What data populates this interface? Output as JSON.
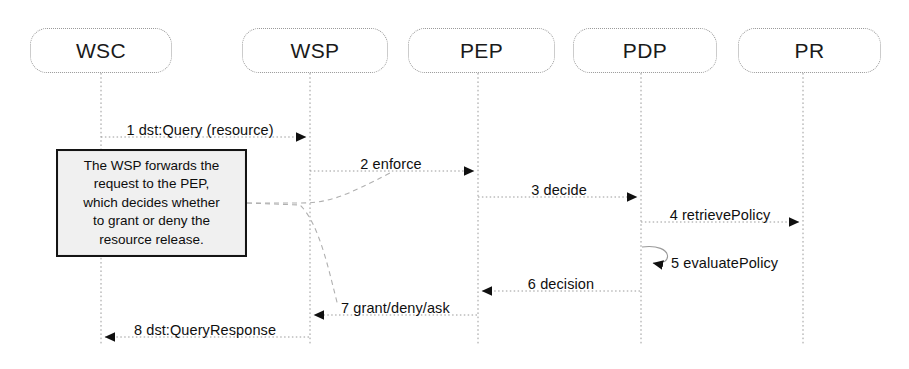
{
  "diagram": {
    "type": "uml-sequence-diagram",
    "title": "",
    "canvas": {
      "width": 909,
      "height": 369
    },
    "colors": {
      "background": "#ffffff",
      "line": "#9a9a9a",
      "arrow": "#1a1a1a",
      "text": "#0f0f0f",
      "note_fill": "#f0f0f0",
      "note_border": "#141414"
    }
  },
  "lifelines": [
    {
      "id": "wsc",
      "label": "WSC",
      "x": 101,
      "box": {
        "left": 30,
        "top": 28,
        "width": 142,
        "height": 45
      },
      "bottom": 345
    },
    {
      "id": "wsp",
      "label": "WSP",
      "x": 310,
      "box": {
        "left": 242,
        "top": 28,
        "width": 146,
        "height": 45
      },
      "bottom": 345
    },
    {
      "id": "pep",
      "label": "PEP",
      "x": 478,
      "box": {
        "left": 408,
        "top": 28,
        "width": 147,
        "height": 45
      },
      "bottom": 345
    },
    {
      "id": "pdp",
      "label": "PDP",
      "x": 641,
      "box": {
        "left": 573,
        "top": 28,
        "width": 144,
        "height": 45
      },
      "bottom": 345
    },
    {
      "id": "pr",
      "label": "PR",
      "x": 803,
      "box": {
        "left": 738,
        "top": 28,
        "width": 143,
        "height": 45
      },
      "bottom": 345
    }
  ],
  "messages": [
    {
      "seq": "1",
      "label": "1 dst:Query (resource)",
      "from": "wsc",
      "to": "wsp",
      "y": 137,
      "direction": "right",
      "kind": "call",
      "label_x": 200,
      "label_y": 122,
      "label_anchor": "center"
    },
    {
      "seq": "2",
      "label": "2 enforce",
      "from": "wsp",
      "to": "pep",
      "y": 171,
      "direction": "right",
      "kind": "call",
      "label_x": 391,
      "label_y": 156,
      "label_anchor": "center"
    },
    {
      "seq": "3",
      "label": "3 decide",
      "from": "pep",
      "to": "pdp",
      "y": 197,
      "direction": "right",
      "kind": "call",
      "label_x": 559,
      "label_y": 182,
      "label_anchor": "center"
    },
    {
      "seq": "4",
      "label": "4 retrievePolicy",
      "from": "pdp",
      "to": "pr",
      "y": 222,
      "direction": "right",
      "kind": "call",
      "label_x": 720,
      "label_y": 207,
      "label_anchor": "center"
    },
    {
      "seq": "5",
      "label": "5 evaluatePolicy",
      "from": "pdp",
      "to": "pdp",
      "y": 263,
      "direction": "self",
      "kind": "self-call",
      "label_x": 671,
      "label_y": 255,
      "label_anchor": "start"
    },
    {
      "seq": "6",
      "label": "6 decision",
      "from": "pdp",
      "to": "pep",
      "y": 291,
      "direction": "left",
      "kind": "return",
      "label_x": 561,
      "label_y": 276,
      "label_anchor": "center"
    },
    {
      "seq": "7",
      "label": "7 grant/deny/ask",
      "from": "pep",
      "to": "wsp",
      "y": 315,
      "direction": "left",
      "kind": "return",
      "label_x": 341,
      "label_y": 300,
      "label_anchor": "start"
    },
    {
      "seq": "8",
      "label": "8 dst:QueryResponse",
      "from": "wsp",
      "to": "wsc",
      "y": 337,
      "direction": "left",
      "kind": "return",
      "label_x": 205,
      "label_y": 322,
      "label_anchor": "center"
    }
  ],
  "note": {
    "id": "wsp-forward-note",
    "lines": [
      "The WSP forwards the",
      "request to the PEP,",
      "which decides whether",
      "to grant or deny the",
      "resource release."
    ],
    "text": "The WSP forwards the request to the PEP, which decides whether to grant or deny the resource release.",
    "box": {
      "left": 56,
      "top": 149,
      "width": 191,
      "height": 108
    },
    "anchor_targets": [
      "message-2",
      "message-7"
    ]
  }
}
